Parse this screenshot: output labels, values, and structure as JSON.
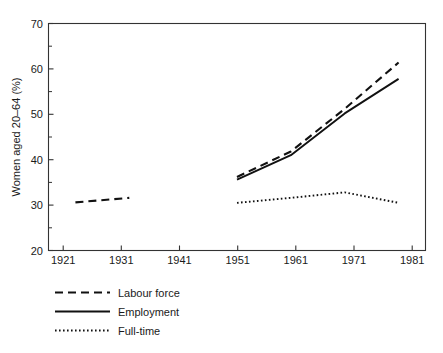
{
  "chart_data": {
    "type": "line",
    "title": "",
    "xlabel": "",
    "ylabel": "Women aged 20–64 (%)",
    "xlim": [
      1916,
      1986
    ],
    "ylim": [
      20,
      70
    ],
    "grid": false,
    "legend_position": "below-left",
    "x_ticks": [
      "1921",
      "1931",
      "1941",
      "1951",
      "1961",
      "1971",
      "1981"
    ],
    "y_ticks": [
      "20",
      "30",
      "40",
      "50",
      "60",
      "70"
    ],
    "y_minor_ticks": [
      "25",
      "35",
      "45",
      "55",
      "65"
    ],
    "x": [
      1921,
      1931,
      1941,
      1951,
      1961,
      1971,
      1981
    ],
    "series": [
      {
        "name": "Labour force",
        "style": "dashed",
        "values": [
          30.6,
          31.6,
          null,
          36.2,
          41.8,
          51.2,
          61.4
        ]
      },
      {
        "name": "Employment",
        "style": "solid",
        "values": [
          null,
          null,
          null,
          35.6,
          41.0,
          50.2,
          57.8
        ]
      },
      {
        "name": "Full-time",
        "style": "dotted",
        "values": [
          null,
          null,
          null,
          30.5,
          31.6,
          32.8,
          30.5
        ]
      }
    ]
  },
  "legend": {
    "items": [
      {
        "label": "Labour force",
        "style": "dashed"
      },
      {
        "label": "Employment",
        "style": "solid"
      },
      {
        "label": "Full-time",
        "style": "dotted"
      }
    ]
  }
}
